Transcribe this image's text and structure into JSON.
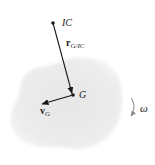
{
  "diagram": {
    "type": "rigid-body-kinematics",
    "colors": {
      "body_fill": "#ececec",
      "body_edge": "#f4f4f4",
      "vector": "#1a1a1a",
      "omega_arrow": "#888888",
      "text": "#222222"
    },
    "labels": {
      "ic": "IC",
      "r_main": "r",
      "r_sub": "G/IC",
      "g": "G",
      "v_main": "v",
      "v_sub": "G",
      "omega": "ω"
    },
    "points": {
      "ic": {
        "x": 53,
        "y": 23
      },
      "g": {
        "x": 73,
        "y": 95
      }
    },
    "vectors": [
      {
        "name": "r_G/IC",
        "from": "ic",
        "to": "g"
      },
      {
        "name": "v_G",
        "from": "g",
        "to": {
          "x": 41,
          "y": 104
        }
      }
    ]
  }
}
